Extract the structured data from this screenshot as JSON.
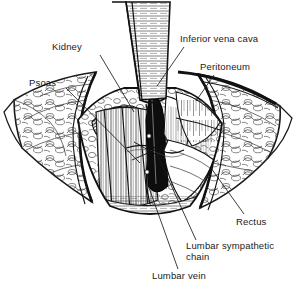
{
  "figure": {
    "background_color": "#ffffff",
    "ink_color": "#1a1a1a",
    "width": 296,
    "height": 290,
    "style": "pen-and-ink line drawing, black on white"
  },
  "labels": [
    {
      "id": "kidney",
      "text": "Kidney",
      "x": 52,
      "y": 41,
      "leader_from": [
        100,
        55
      ],
      "leader_to": [
        134,
        112
      ]
    },
    {
      "id": "psoas",
      "text": "Psoas",
      "x": 29,
      "y": 77,
      "leader_from": [
        66,
        88
      ],
      "leader_to": [
        140,
        163
      ]
    },
    {
      "id": "inferior-vena-cava",
      "text": "Inferior vena cava",
      "x": 180,
      "y": 33,
      "leader_from": [
        184,
        47
      ],
      "leader_to": [
        157,
        86
      ]
    },
    {
      "id": "peritoneum",
      "text": "Peritoneum",
      "x": 200,
      "y": 61,
      "leader_from": [
        214,
        75
      ],
      "leader_to": [
        196,
        101
      ]
    },
    {
      "id": "rectus",
      "text": "Rectus",
      "x": 236,
      "y": 216,
      "leader_from": [
        244,
        214
      ],
      "leader_to": [
        211,
        168
      ]
    },
    {
      "id": "lumbar-sympathetic-chain",
      "text": "Lumbar sympathetic\nchain",
      "x": 186,
      "y": 240,
      "leader_from": [
        196,
        240
      ],
      "leader_to": [
        156,
        152
      ]
    },
    {
      "id": "lumbar-vein",
      "text": "Lumbar vein",
      "x": 152,
      "y": 270,
      "leader_from": [
        178,
        269
      ],
      "leader_to": [
        148,
        185
      ]
    }
  ],
  "anatomy_parts": [
    "skin-and-fat-flap-left",
    "skin-and-fat-flap-right",
    "wound-margin",
    "retractor-blade-upper",
    "retractor-blade-lower",
    "kidney",
    "psoas-muscle",
    "peritoneum",
    "inferior-vena-cava",
    "lumbar-vein",
    "lumbar-sympathetic-chain",
    "rectus-muscle",
    "vertebral-body"
  ]
}
